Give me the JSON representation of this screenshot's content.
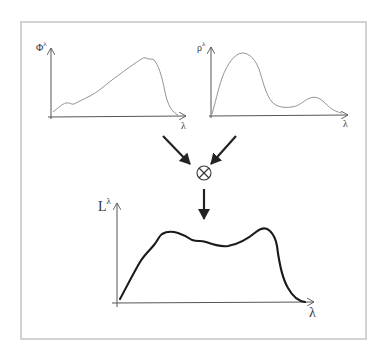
{
  "diagram": {
    "operator_symbol": "⊗",
    "colors": {
      "frame": "#d2d2d2",
      "axis": "#555555",
      "thin_curve": "#888888",
      "thick_curve": "#1a1a1a",
      "arrow": "#222222"
    }
  },
  "graphs": {
    "illuminant": {
      "y_label": "Φ",
      "y_label_sup": "λ",
      "x_label": "λ",
      "curve": "M53,112 C58,108 62,104 66,103 C70,102 71,105 74,104 C80,101 84,99 90,96 C98,92 104,86 112,80 C120,74 128,68 134,64 C140,60 143,57 146,58 C149,60 151,58 154,60 C158,64 162,76 165,92 C168,106 172,112 178,115"
    },
    "reflectance": {
      "y_label": "ρ",
      "y_label_sup": "λ",
      "x_label": "λ",
      "curve": "M212,114 C215,104 218,90 222,78 C228,62 235,54 242,53 C250,53 256,60 260,72 C264,86 267,96 272,102 C277,107 283,108 292,107 C300,106 304,100 310,98 C316,96 320,98 326,104 C331,109 336,112 342,113"
    },
    "radiance": {
      "y_label": "L",
      "y_label_sup": "λ",
      "x_label": "λ",
      "curve": "M120,299 C126,288 133,274 140,262 C145,254 150,250 154,245 C158,240 159,236 162,234 C167,231 172,231 178,233 C184,235 188,237 192,240 C198,242 200,240 206,242 C214,245 220,247 228,246 C240,244 250,237 256,232 C261,228 266,227 270,231 C274,235 276,240 277,246 C279,262 282,278 288,288 C293,297 298,301 305,302"
    }
  }
}
